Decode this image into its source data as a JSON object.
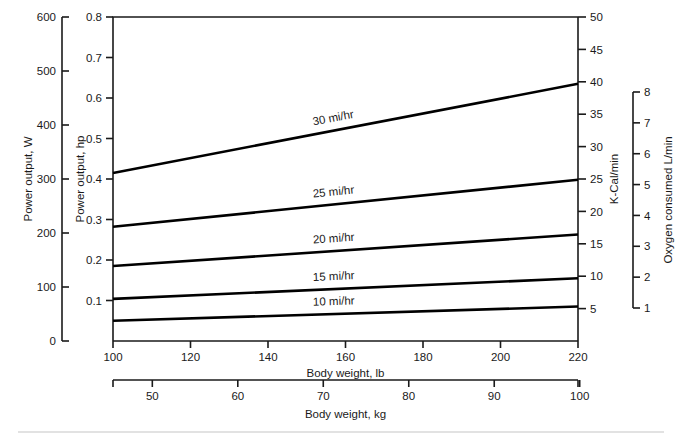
{
  "chart_data": {
    "type": "line",
    "title": "",
    "xlabel": "Body weight, lb",
    "xlabel_secondary": "Body weight, kg",
    "ylabel": "Power output, hp",
    "ylabel_secondary_left": "Power output, W",
    "ylabel_secondary_right": "K-Cal/min",
    "ylabel_tertiary_right": "Oxygen consumed L/min",
    "grid": false,
    "legend_position": "inline-on-curves",
    "x": [
      100,
      220
    ],
    "xlim": [
      100,
      220
    ],
    "xticks": [
      100,
      120,
      140,
      160,
      180,
      200,
      220
    ],
    "xticklabels": [
      "100",
      "120",
      "140",
      "160",
      "180",
      "200",
      "220"
    ],
    "xticks_kg": [
      50,
      60,
      70,
      80,
      90,
      100
    ],
    "xticklabels_kg": [
      "50",
      "60",
      "70",
      "80",
      "90",
      "100"
    ],
    "xlim_kg": [
      45.4,
      99.8
    ],
    "ylim": [
      0.0,
      0.8
    ],
    "yticks": [
      0.0,
      0.1,
      0.2,
      0.3,
      0.4,
      0.5,
      0.6,
      0.7,
      0.8
    ],
    "yticklabels": [
      "0.1",
      "0.2",
      "0.3",
      "0.4",
      "0.5",
      "0.6",
      "0.7",
      "0.8"
    ],
    "ylim_watts": [
      0,
      600
    ],
    "yticks_watts": [
      0,
      100,
      200,
      300,
      400,
      500,
      600
    ],
    "yticklabels_watts": [
      "0",
      "100",
      "200",
      "300",
      "400",
      "500",
      "600"
    ],
    "ylim_kcal": [
      0,
      50
    ],
    "yticks_kcal": [
      5,
      10,
      15,
      20,
      25,
      30,
      35,
      40,
      45,
      50
    ],
    "yticklabels_kcal": [
      "5",
      "10",
      "15",
      "20",
      "25",
      "30",
      "35",
      "40",
      "45",
      "50"
    ],
    "ylim_oxygen": [
      1,
      8
    ],
    "yticks_oxygen": [
      1,
      2,
      3,
      4,
      5,
      6,
      7,
      8
    ],
    "yticklabels_oxygen": [
      "1",
      "2",
      "3",
      "4",
      "5",
      "6",
      "7",
      "8"
    ],
    "series": [
      {
        "name": "30 mi/hr",
        "label": "30 mi/hr",
        "x": [
          100,
          220
        ],
        "values": [
          0.415,
          0.635
        ],
        "label_x": 157,
        "label_y_offset": -9
      },
      {
        "name": "25 mi/hr",
        "label": "25 mi/hr",
        "x": [
          100,
          220
        ],
        "values": [
          0.282,
          0.398
        ],
        "label_x": 157,
        "label_y_offset": -9
      },
      {
        "name": "20 mi/hr",
        "label": "20 mi/hr",
        "x": [
          100,
          220
        ],
        "values": [
          0.185,
          0.263
        ],
        "label_x": 157,
        "label_y_offset": -9
      },
      {
        "name": "15 mi/hr",
        "label": "15 mi/hr",
        "x": [
          100,
          220
        ],
        "values": [
          0.104,
          0.155
        ],
        "label_x": 157,
        "label_y_offset": -9
      },
      {
        "name": "10 mi/hr",
        "label": "10 mi/hr",
        "x": [
          100,
          220
        ],
        "values": [
          0.05,
          0.085
        ],
        "label_x": 157,
        "label_y_offset": -9
      }
    ],
    "colors": {
      "line": "#000000",
      "axis": "#1a1a1a",
      "background": "#ffffff",
      "rule": "#d8d8d8"
    }
  },
  "geometry": {
    "plot": {
      "left": 113,
      "right": 578,
      "top": 17,
      "bottom": 341
    },
    "watts_axis_x": 62,
    "kcal_axis_x": 578,
    "oxygen_axis_x": 633,
    "oxygen_top": 92,
    "oxygen_bottom": 308,
    "lb_axis_y": 341,
    "kg_axis_y": 380,
    "kg_left": 113,
    "kg_right": 578,
    "rule_y": 432
  }
}
